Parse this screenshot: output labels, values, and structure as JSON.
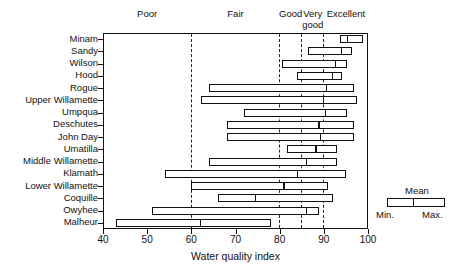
{
  "chart_data": {
    "type": "bar",
    "subtype": "range-bar-with-mean",
    "title": "",
    "xlabel": "Water quality index",
    "ylabel": "",
    "xlim": [
      40,
      100
    ],
    "xticks": [
      40,
      50,
      60,
      70,
      80,
      90,
      100
    ],
    "grid": "vertical dashed at category boundaries",
    "legend_position": "right-outside",
    "categories": [
      "Minam",
      "Sandy",
      "Wilson",
      "Hood",
      "Rogue",
      "Upper Willamette",
      "Umpqua",
      "Deschutes",
      "John Day",
      "Umatilla",
      "Middle Willamette",
      "Klamath",
      "Lower Willamette",
      "Coquille",
      "Owyhee",
      "Malheur"
    ],
    "series": [
      {
        "name": "Min.",
        "values": [
          93.6,
          86.5,
          80.6,
          84.0,
          63.9,
          62.3,
          72.0,
          68.1,
          68.1,
          81.7,
          63.9,
          54.1,
          60.0,
          66.0,
          51.0,
          43.0
        ]
      },
      {
        "name": "Mean",
        "values": [
          95.4,
          94.0,
          92.7,
          92.0,
          90.6,
          89.9,
          90.4,
          88.9,
          89.3,
          88.2,
          86.1,
          84.0,
          81.0,
          74.5,
          86.0,
          62.0
        ]
      },
      {
        "name": "Max.",
        "values": [
          98.9,
          96.4,
          95.2,
          94.2,
          96.8,
          97.6,
          95.2,
          96.8,
          96.8,
          93.0,
          93.0,
          95.0,
          91.0,
          92.0,
          89.0,
          78.0
        ]
      }
    ],
    "quality_bands": [
      {
        "label": "Poor",
        "from": 40,
        "to": 60
      },
      {
        "label": "Fair",
        "from": 60,
        "to": 80
      },
      {
        "label": "Good",
        "from": 80,
        "to": 85
      },
      {
        "label": "Very\ngood",
        "from": 85,
        "to": 90
      },
      {
        "label": "Excellent",
        "from": 90,
        "to": 100
      }
    ],
    "band_boundaries": [
      60,
      80,
      85,
      90
    ]
  },
  "band_labels": [
    {
      "label": "Poor",
      "center": 50
    },
    {
      "label": "Fair",
      "center": 70
    },
    {
      "label": "Good",
      "center": 82.5
    },
    {
      "label": "Very",
      "center": 87.5
    },
    {
      "label": "good",
      "center": 87.5
    },
    {
      "label": "Excellent",
      "center": 95
    }
  ],
  "axis": {
    "x_title": "Water quality index",
    "x_tick_labels": [
      "40",
      "50",
      "60",
      "70",
      "80",
      "90",
      "100"
    ]
  },
  "legend": {
    "mean_label": "Mean",
    "min_label": "Min.",
    "max_label": "Max."
  }
}
